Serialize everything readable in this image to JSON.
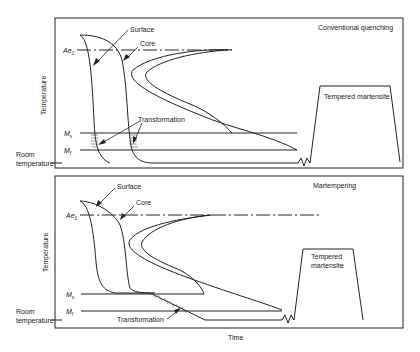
{
  "panels": [
    {
      "title": "Conventional quenching",
      "labels": {
        "surface": "Surface",
        "core": "Core",
        "ae1": "Ae",
        "ae1_sub": "1",
        "ms": "M",
        "ms_sub": "s",
        "mf": "M",
        "mf_sub": "f",
        "transformation": "Transformation",
        "tempered": "Tempered martensite",
        "y_axis": "Temperature",
        "room_temp_1": "Room",
        "room_temp_2": "temperature"
      }
    },
    {
      "title": "Martempering",
      "labels": {
        "surface": "Surface",
        "core": "Core",
        "ae1": "Ae",
        "ae1_sub": "1",
        "ms": "M",
        "ms_sub": "s",
        "mf": "M",
        "mf_sub": "f",
        "transformation": "Transformation",
        "tempered_1": "Tempered",
        "tempered_2": "martensite",
        "y_axis": "Temperature",
        "room_temp_1": "Room",
        "room_temp_2": "temperature"
      }
    }
  ],
  "x_axis": "Time"
}
